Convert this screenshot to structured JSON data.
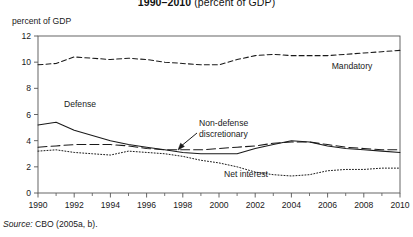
{
  "figure": {
    "title_years": "1990–2010",
    "title_tail": "(percent of GDP)",
    "axis_caption": "percent of GDP",
    "source_lead": "Source:",
    "source_text": "CBO (2005a, b)."
  },
  "labels": {
    "mandatory": "Mandatory",
    "defense": "Defense",
    "nondefense_line1": "Non-defense",
    "nondefense_line2": "discretionary",
    "net_interest": "Net interest"
  },
  "colors": {
    "line": "#1a1a1a",
    "frame": "#555555",
    "background": "#ffffff"
  },
  "chart_data": {
    "type": "line",
    "title": "1990–2010 (percent of GDP)",
    "xlabel": "",
    "ylabel": "percent of GDP",
    "xlim": [
      1990,
      2010
    ],
    "ylim": [
      0,
      12
    ],
    "ytick_labels": [
      "0",
      "2",
      "4",
      "6",
      "8",
      "10",
      "12"
    ],
    "yticks": [
      0,
      2,
      4,
      6,
      8,
      10,
      12
    ],
    "xtick_labels": [
      "1990",
      "1992",
      "1994",
      "1996",
      "1998",
      "2000",
      "2002",
      "2004",
      "2006",
      "2008",
      "2010"
    ],
    "xticks": [
      1990,
      1992,
      1994,
      1996,
      1998,
      2000,
      2002,
      2004,
      2006,
      2008,
      2010
    ],
    "minor_xticks": [
      1991,
      1993,
      1995,
      1997,
      1999,
      2001,
      2003,
      2005,
      2007,
      2009
    ],
    "grid": false,
    "legend_position": "inline-annotations",
    "x": [
      1990,
      1991,
      1992,
      1993,
      1994,
      1995,
      1996,
      1997,
      1998,
      1999,
      2000,
      2001,
      2002,
      2003,
      2004,
      2005,
      2006,
      2007,
      2008,
      2009,
      2010
    ],
    "series": [
      {
        "name": "Mandatory",
        "style": "dashed",
        "values": [
          9.8,
          9.9,
          10.4,
          10.3,
          10.2,
          10.3,
          10.2,
          10.0,
          9.9,
          9.8,
          9.8,
          10.2,
          10.5,
          10.6,
          10.5,
          10.5,
          10.5,
          10.6,
          10.7,
          10.8,
          10.9
        ]
      },
      {
        "name": "Defense",
        "style": "solid",
        "values": [
          5.2,
          5.4,
          4.8,
          4.4,
          4.0,
          3.7,
          3.5,
          3.3,
          3.1,
          3.0,
          3.0,
          3.0,
          3.4,
          3.7,
          4.0,
          3.9,
          3.6,
          3.4,
          3.3,
          3.2,
          3.1
        ]
      },
      {
        "name": "Non-defense discretionary",
        "style": "dashed-long",
        "values": [
          3.5,
          3.6,
          3.7,
          3.7,
          3.7,
          3.6,
          3.4,
          3.3,
          3.3,
          3.3,
          3.4,
          3.5,
          3.6,
          3.8,
          3.9,
          3.9,
          3.7,
          3.5,
          3.4,
          3.3,
          3.3
        ]
      },
      {
        "name": "Net interest",
        "style": "dotted",
        "values": [
          3.2,
          3.3,
          3.1,
          3.0,
          2.9,
          3.2,
          3.1,
          3.0,
          2.8,
          2.5,
          2.3,
          2.0,
          1.6,
          1.4,
          1.3,
          1.4,
          1.7,
          1.8,
          1.8,
          1.9,
          1.9
        ]
      }
    ]
  }
}
